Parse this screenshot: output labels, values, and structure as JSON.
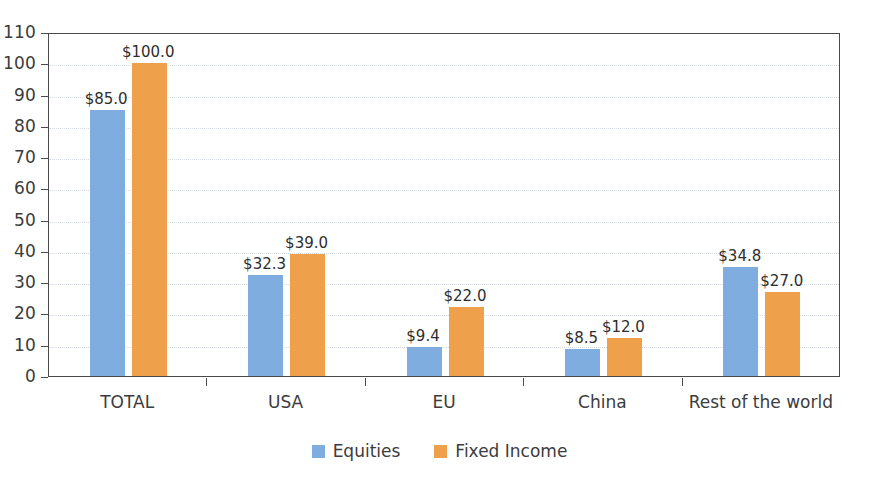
{
  "chart_data": {
    "type": "bar",
    "title": "",
    "xlabel": "",
    "ylabel": "",
    "ylim": [
      0,
      110
    ],
    "ytick_step": 10,
    "grid": true,
    "legend_position": "bottom-center",
    "categories": [
      "TOTAL",
      "USA",
      "EU",
      "China",
      "Rest of the world"
    ],
    "yticks": [
      "0",
      "10",
      "20",
      "30",
      "40",
      "50",
      "60",
      "70",
      "80",
      "90",
      "100",
      "110"
    ],
    "series": [
      {
        "name": "Equities",
        "color": "#7FADE0",
        "values": [
          85.0,
          32.3,
          9.4,
          8.5,
          34.8
        ],
        "labels": [
          "$85.0",
          "$32.3",
          "$9.4",
          "$8.5",
          "$34.8"
        ]
      },
      {
        "name": "Fixed Income",
        "color": "#EFA04A",
        "values": [
          100.0,
          39.0,
          22.0,
          12.0,
          27.0
        ],
        "labels": [
          "$100.0",
          "$39.0",
          "$22.0",
          "$12.0",
          "$27.0"
        ]
      }
    ]
  },
  "legend": {
    "items": [
      {
        "label": "Equities",
        "swatch": "equities"
      },
      {
        "label": "Fixed Income",
        "swatch": "fixedincome"
      }
    ]
  },
  "colors": {
    "equities": "#7FADE0",
    "fixed_income": "#EFA04A",
    "axis": "#4a4a4a",
    "grid": "#d8dde3",
    "text": "#3c3c3c"
  }
}
